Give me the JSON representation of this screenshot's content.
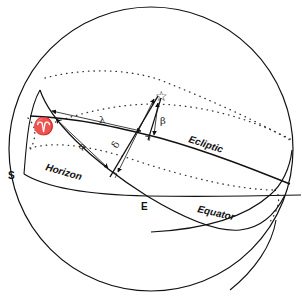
{
  "diagram": {
    "labels": {
      "south": "S",
      "east": "E",
      "horizon": "Horizon",
      "ecliptic": "Ecliptic",
      "equator": "Equator",
      "vernal_equinox_symbol": "♈",
      "star_symbol": "☆",
      "ecliptic_longitude": "λ",
      "ecliptic_latitude": "β",
      "right_ascension": "α",
      "declination": "δ"
    },
    "colors": {
      "stroke": "#111111",
      "background": "#ffffff"
    }
  }
}
